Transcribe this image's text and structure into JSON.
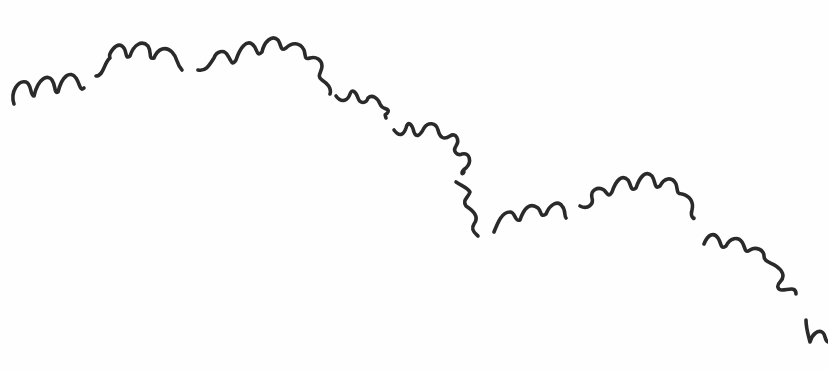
{
  "drawing": {
    "description": "Hand-drawn scalloped squiggle line descending from upper-left to lower-right",
    "stroke_color": "#2a2a2a",
    "background_color": "#ffffff",
    "segments": [
      {
        "name": "squiggle-1",
        "d": "M14,104 C10,92 18,80 26,82 C32,84 30,96 34,96 C38,78 48,74 52,80 C56,86 54,94 58,92 C62,76 70,70 76,78 C80,84 80,92 84,88"
      },
      {
        "name": "squiggle-2",
        "d": "M96,76 C104,76 104,62 110,58 C108,54 116,42 122,46 C128,50 124,60 130,56 C134,44 142,40 148,46 C152,52 148,60 154,58 C158,48 166,46 172,52 C178,58 176,64 182,70"
      },
      {
        "name": "squiggle-3",
        "d": "M198,70 C206,72 210,64 214,58 C216,52 224,48 228,56 C232,62 232,66 236,60 C240,48 246,40 252,44 C258,48 256,58 262,52 C264,42 272,34 278,40 C282,46 280,52 286,48 C292,42 300,42 304,50 C306,56 304,60 310,58 C316,56 322,60 322,66 C322,72 316,76 322,80 C328,84 332,88 330,94"
      },
      {
        "name": "squiggle-4",
        "d": "M336,96 C342,104 348,100 350,94 C352,88 356,92 358,98 C360,104 366,104 368,98 C372,94 378,98 380,104 C382,110 390,108 388,112 C386,116 384,112 386,118"
      },
      {
        "name": "squiggle-5",
        "d": "M394,130 C400,138 404,134 406,128 C408,120 412,124 414,132 C416,138 420,136 424,128 C428,122 436,122 438,130 C440,138 444,140 450,136 C456,132 460,140 456,146 C452,152 458,156 462,154 C470,152 472,162 466,168 C460,172 462,176 464,172"
      },
      {
        "name": "squiggle-6",
        "d": "M456,182 C462,186 468,188 470,192 C468,198 462,200 466,206 C472,210 480,216 474,224 C470,230 476,234 478,236"
      },
      {
        "name": "squiggle-7",
        "d": "M494,232 C498,222 502,212 510,212 C516,212 514,222 520,220 C524,208 530,202 538,208 C542,212 540,218 546,214 C550,204 558,200 562,206 C566,210 564,216 566,218"
      },
      {
        "name": "squiggle-8",
        "d": "M580,206 C588,210 594,204 592,198 C590,190 598,186 604,190 C608,194 608,198 612,192 C616,180 622,174 628,180 C632,186 630,192 636,188 C640,176 646,170 652,176 C656,182 654,190 660,186 C664,178 672,176 676,184 C678,190 676,194 682,194 C690,196 694,202 692,210 C690,216 694,220 694,218"
      },
      {
        "name": "squiggle-9",
        "d": "M704,244 C708,234 714,232 718,238 C722,244 720,250 726,246 C730,238 738,236 742,242 C746,248 744,254 750,250 C756,246 764,250 764,256 C764,262 770,262 776,266 C782,270 786,276 780,282 C776,286 778,290 782,290 C788,290 796,286 796,294"
      },
      {
        "name": "squiggle-10",
        "d": "M806,320 C806,328 808,334 810,342 C812,334 818,330 822,332 C826,334 824,340 828,342"
      }
    ]
  }
}
